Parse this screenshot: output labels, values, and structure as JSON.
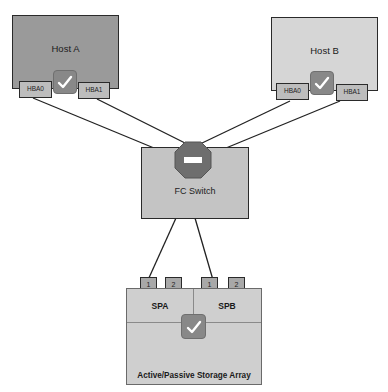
{
  "diagram": {
    "colors": {
      "host_a_fill": "#9a9a9a",
      "host_b_fill": "#d6d6d6",
      "switch_fill": "#c4c4c4",
      "array_fill": "#cfcfcf",
      "stop_sign": "#6e6e6e",
      "line": "#222222"
    },
    "hosts": [
      {
        "label": "Host A",
        "hbas": [
          "HBA0",
          "HBA1"
        ],
        "status_icon": "checkmark"
      },
      {
        "label": "Host B",
        "hbas": [
          "HBA0",
          "HBA1"
        ],
        "status_icon": "checkmark"
      }
    ],
    "switch": {
      "label": "FC Switch",
      "status_icon": "stop-sign"
    },
    "array": {
      "label": "Active/Passive Storage Array",
      "status_icon": "checkmark",
      "processors": [
        {
          "label": "SPA",
          "ports": [
            "1",
            "2"
          ]
        },
        {
          "label": "SPB",
          "ports": [
            "1",
            "2"
          ]
        }
      ]
    },
    "connections": [
      {
        "from": "Host A HBA0",
        "to": "FC Switch"
      },
      {
        "from": "Host A HBA1",
        "to": "FC Switch"
      },
      {
        "from": "Host B HBA0",
        "to": "FC Switch"
      },
      {
        "from": "Host B HBA1",
        "to": "FC Switch"
      },
      {
        "from": "FC Switch",
        "to": "SPA port 1"
      },
      {
        "from": "FC Switch",
        "to": "SPB port 1"
      }
    ]
  }
}
